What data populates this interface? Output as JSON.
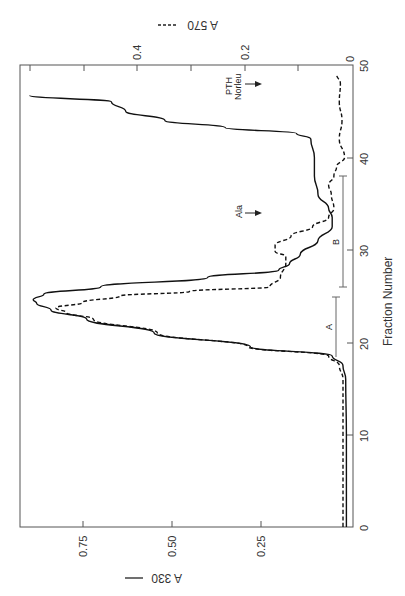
{
  "chart_data": {
    "type": "line",
    "orientation": "rotated 90 degrees (fraction number runs bottom-to-top along right side)",
    "title": "",
    "xlabel": "Fraction Number",
    "x_ticks": [
      0,
      10,
      20,
      30,
      40,
      50
    ],
    "xlim": [
      0,
      50
    ],
    "y_axes": [
      {
        "label": "A 330",
        "line_style": "solid",
        "ticks": [
          "0",
          "0.25",
          "0.50",
          "0.75"
        ],
        "ylim": [
          0,
          0.93
        ]
      },
      {
        "label": "A 570",
        "line_style": "dashed",
        "ticks": [
          "0",
          "0.2",
          "0.4"
        ],
        "ylim": [
          0,
          0.6
        ]
      }
    ],
    "series": [
      {
        "name": "A 330",
        "style": "solid",
        "axis": "A 330",
        "x": [
          0,
          10,
          16,
          17.5,
          18.5,
          19.5,
          21,
          22.5,
          23.5,
          24.2,
          24.6,
          25.2,
          26,
          27,
          27.8,
          28.5,
          29.5,
          31,
          32.5,
          33.5,
          34.5,
          36,
          38,
          40,
          42,
          42.6,
          43.2,
          44,
          45,
          46,
          46.7
        ],
        "values": [
          0.01,
          0.01,
          0.012,
          0.02,
          0.05,
          0.28,
          0.55,
          0.74,
          0.84,
          0.88,
          0.89,
          0.86,
          0.7,
          0.4,
          0.2,
          0.17,
          0.14,
          0.09,
          0.05,
          0.05,
          0.06,
          0.09,
          0.1,
          0.1,
          0.11,
          0.15,
          0.35,
          0.52,
          0.63,
          0.67,
          0.9
        ]
      },
      {
        "name": "A 570",
        "style": "dashed",
        "axis": "A 570",
        "x": [
          0,
          10,
          16,
          17.5,
          18.5,
          19.5,
          21,
          22.5,
          23.2,
          23.7,
          24.3,
          25,
          25.5,
          26,
          27,
          28.5,
          29.3,
          29.8,
          30.5,
          31.5,
          32.5,
          33.5,
          34.5,
          36,
          37,
          38,
          39,
          40,
          42,
          44,
          46,
          48,
          49
        ],
        "values": [
          0.013,
          0.013,
          0.013,
          0.02,
          0.04,
          0.19,
          0.36,
          0.48,
          0.53,
          0.55,
          0.5,
          0.43,
          0.3,
          0.15,
          0.13,
          0.12,
          0.12,
          0.14,
          0.14,
          0.11,
          0.07,
          0.04,
          0.03,
          0.035,
          0.04,
          0.03,
          0.025,
          0.01,
          0.02,
          0.015,
          0.02,
          0.018,
          0.025
        ]
      }
    ],
    "annotations": [
      {
        "text": "A",
        "type": "range-bar",
        "from": 18.5,
        "to": 25
      },
      {
        "text": "B",
        "type": "range-bar",
        "from": 26,
        "to": 38
      },
      {
        "text": "Ala",
        "type": "arrow",
        "at_fraction": 35,
        "direction": "toward baseline"
      },
      {
        "text": "PTH Norleu",
        "type": "arrow",
        "at_fraction": 48.5,
        "direction": "toward baseline"
      }
    ],
    "grid": false,
    "legend": "axis labels with line-style samples"
  },
  "labels": {
    "x_axis_title": "Fraction Number",
    "y_left_title": "A 330",
    "y_right_title": "A 570",
    "x_ticks": [
      "0",
      "10",
      "20",
      "30",
      "40",
      "50"
    ],
    "a330_ticks": [
      "0.25",
      "0.50",
      "0.75"
    ],
    "a570_ticks": [
      "0",
      "0.2",
      "0.4"
    ],
    "range_a": "A",
    "range_b": "B",
    "arrow_ala": "Ala",
    "arrow_pth_1": "PTH",
    "arrow_pth_2": "Norleu"
  }
}
